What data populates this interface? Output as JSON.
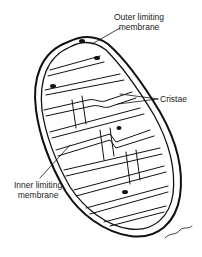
{
  "figure": {
    "labels": {
      "outer_line1": "Outer limiting",
      "outer_line2": "membrane",
      "cristae": "Cristae",
      "inner_line1": "Inner limiting",
      "inner_line2": "membrane"
    },
    "signature": "artist signature"
  }
}
